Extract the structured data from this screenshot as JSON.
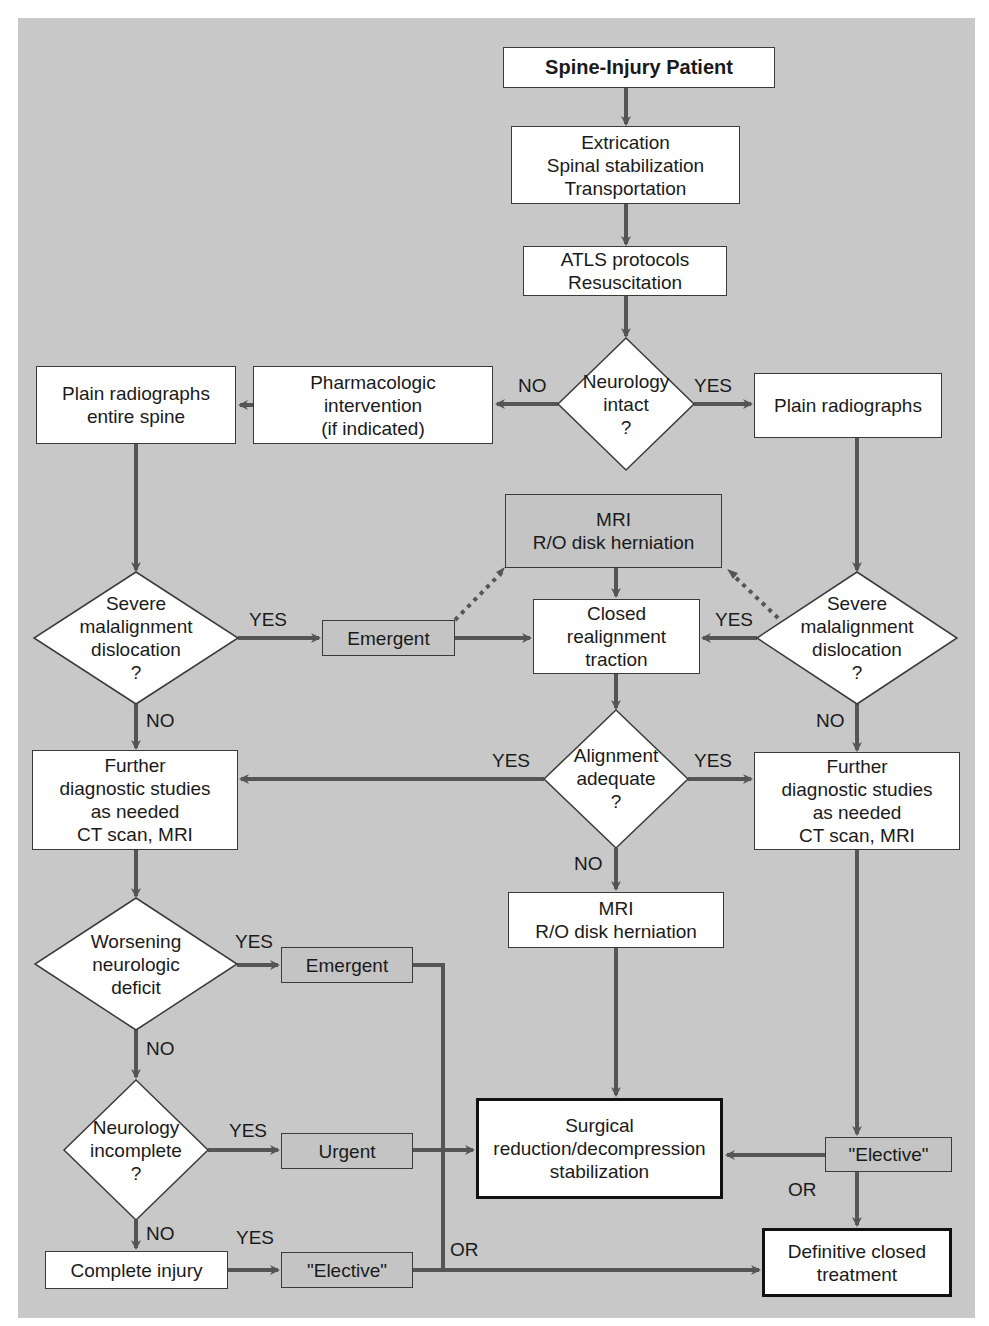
{
  "diagram": {
    "title": "Spine-Injury Patient",
    "colors": {
      "panel_background": "#c8c8c8",
      "node_fill": "#ffffff",
      "gray_node_fill": "#c4c4c4",
      "connector": "#555555"
    },
    "nodes": {
      "start": {
        "lines": [
          "Spine-Injury Patient"
        ]
      },
      "extrication": {
        "lines": [
          "Extrication",
          "Spinal stabilization",
          "Transportation"
        ]
      },
      "atls": {
        "lines": [
          "ATLS protocols",
          "Resuscitation"
        ]
      },
      "neurology_intact": {
        "lines": [
          "Neurology",
          "intact",
          "?"
        ]
      },
      "pharmacologic": {
        "lines": [
          "Pharmacologic",
          "intervention",
          "(if indicated)"
        ]
      },
      "plain_entire": {
        "lines": [
          "Plain radiographs",
          "entire spine"
        ]
      },
      "plain_right": {
        "lines": [
          "Plain radiographs"
        ]
      },
      "mri_top": {
        "lines": [
          "MRI",
          "R/O disk herniation"
        ]
      },
      "closed_realignment": {
        "lines": [
          "Closed",
          "realignment",
          "traction"
        ]
      },
      "emergent_mid": {
        "lines": [
          "Emergent"
        ]
      },
      "severe_left": {
        "lines": [
          "Severe",
          "malalignment",
          "dislocation",
          "?"
        ]
      },
      "severe_right": {
        "lines": [
          "Severe",
          "malalignment",
          "dislocation",
          "?"
        ]
      },
      "further_left": {
        "lines": [
          "Further",
          "diagnostic studies",
          "as needed",
          "CT scan, MRI"
        ]
      },
      "alignment_adequate": {
        "lines": [
          "Alignment",
          "adequate",
          "?"
        ]
      },
      "further_right": {
        "lines": [
          "Further",
          "diagnostic studies",
          "as needed",
          "CT scan, MRI"
        ]
      },
      "mri_lower": {
        "lines": [
          "MRI",
          "R/O disk herniation"
        ]
      },
      "worsening": {
        "lines": [
          "Worsening",
          "neurologic",
          "deficit"
        ]
      },
      "emergent_lower": {
        "lines": [
          "Emergent"
        ]
      },
      "neurology_incomplete": {
        "lines": [
          "Neurology",
          "incomplete",
          "?"
        ]
      },
      "urgent": {
        "lines": [
          "Urgent"
        ]
      },
      "complete_injury": {
        "lines": [
          "Complete injury"
        ]
      },
      "elective_lower": {
        "lines": [
          "\"Elective\""
        ]
      },
      "surgical": {
        "lines": [
          "Surgical",
          "reduction/decompression",
          "stabilization"
        ]
      },
      "elective_right": {
        "lines": [
          "\"Elective\""
        ]
      },
      "definitive": {
        "lines": [
          "Definitive closed",
          "treatment"
        ]
      }
    },
    "edge_labels": {
      "neuro_no": "NO",
      "neuro_yes": "YES",
      "severe_left_yes": "YES",
      "severe_left_no": "NO",
      "severe_right_yes": "YES",
      "severe_right_no": "NO",
      "align_yes_left": "YES",
      "align_yes_right": "YES",
      "align_no": "NO",
      "worsening_yes": "YES",
      "worsening_no": "NO",
      "incomplete_yes": "YES",
      "incomplete_no": "NO",
      "complete_yes": "YES",
      "or_bus": "OR",
      "or_right": "OR"
    }
  }
}
